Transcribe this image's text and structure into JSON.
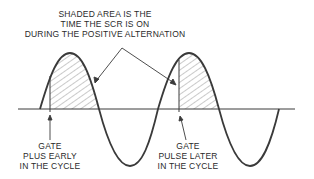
{
  "title_annotation": {
    "lines": [
      "SHADED AREA IS THE",
      "TIME THE SCR IS ON",
      "DURING THE POSITIVE ALTERNATION"
    ]
  },
  "left_label": {
    "lines": [
      "GATE",
      "PLUS EARLY",
      "IN THE CYCLE"
    ]
  },
  "right_label": {
    "lines": [
      "GATE",
      "PULSE LATER",
      "IN THE CYCLE"
    ]
  },
  "colors": {
    "stroke": "#3a3a3a",
    "hatch": "#555555",
    "text": "#2a2a2a"
  }
}
